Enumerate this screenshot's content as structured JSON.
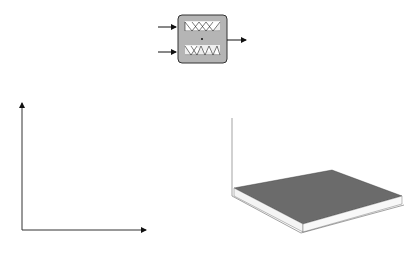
{
  "panel_a": {
    "caption": "a",
    "inputs": [
      "x",
      "x"
    ],
    "input_subscripts": [
      "1",
      "2"
    ],
    "output": "y",
    "operator": "·",
    "block_fill": "#b5b5b5"
  },
  "panel_b": {
    "caption": "b",
    "x_axis_label": "x",
    "x_axis_subscript": "1",
    "y_axis_label": "x",
    "y_axis_subscript": "2",
    "columns": [
      22,
      66,
      80,
      110,
      139
    ],
    "rows": [
      109,
      124,
      139,
      154,
      169,
      185,
      230
    ]
  },
  "panel_c": {
    "caption": "c",
    "z_ticks": [
      "1.2",
      "1",
      "0.8",
      "0.6",
      "0.4",
      "0.2",
      "0",
      "-0.2"
    ],
    "left_axis_ticks": [
      "1",
      "0.5",
      "0",
      "-0.5",
      "-1"
    ],
    "right_axis_ticks": [
      "-1",
      "-0.5",
      "0",
      "0.5",
      "1"
    ]
  },
  "chart_data": {
    "type": "surface",
    "title": "",
    "x": [
      -1,
      -0.5,
      0,
      0.5,
      1
    ],
    "y": [
      -1,
      -0.5,
      0,
      0.5,
      1
    ],
    "zlim": [
      -0.2,
      1.2
    ],
    "peak": {
      "x": 0,
      "y": 0,
      "z": 1
    }
  }
}
